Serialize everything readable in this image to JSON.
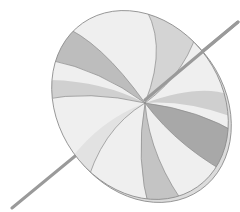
{
  "image": {
    "subject": "spinning top disc on stick",
    "style": "grayscale watercolor",
    "colors": {
      "background": "#ffffff",
      "outline": "#8a8a8a",
      "light": "#ececec",
      "mid": "#c9c9c9",
      "dark": "#9e9e9e",
      "stick": "#9a9a9a"
    }
  }
}
